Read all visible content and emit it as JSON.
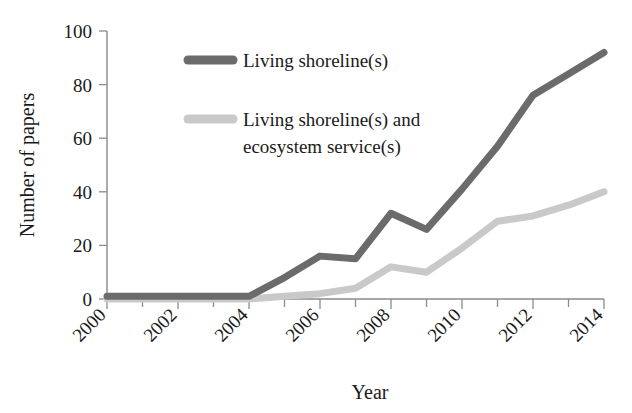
{
  "chart_data": {
    "type": "line",
    "title": "",
    "xlabel": "Year",
    "ylabel": "Number of papers",
    "x": [
      2000,
      2001,
      2002,
      2003,
      2004,
      2005,
      2006,
      2007,
      2008,
      2009,
      2010,
      2011,
      2012,
      2013,
      2014
    ],
    "xlim": [
      2000,
      2014
    ],
    "ylim": [
      0,
      100
    ],
    "xticks": [
      2000,
      2002,
      2004,
      2006,
      2008,
      2010,
      2012,
      2014
    ],
    "xtick_labels": [
      "2000",
      "2002",
      "2004",
      "2006",
      "2008",
      "2010",
      "2012",
      "2014"
    ],
    "xminor_ticks": [
      2001,
      2003,
      2005,
      2007,
      2009,
      2011,
      2013
    ],
    "yticks": [
      0,
      20,
      40,
      60,
      80,
      100
    ],
    "ytick_labels": [
      "0",
      "20",
      "40",
      "60",
      "80",
      "100"
    ],
    "grid": false,
    "legend_position": "upper-left-inside",
    "series": [
      {
        "name": "Living shoreline(s)",
        "color": "#6b6b6b",
        "values": [
          1,
          1,
          1,
          1,
          1,
          8,
          16,
          15,
          32,
          26,
          41,
          57,
          76,
          84,
          92
        ]
      },
      {
        "name": "Living shoreline(s) and ecosystem service(s)",
        "color": "#c9c9c9",
        "values": [
          0,
          0,
          0,
          0,
          0,
          1,
          2,
          4,
          12,
          10,
          19,
          29,
          31,
          35,
          40
        ]
      }
    ]
  },
  "legend": {
    "entries": [
      {
        "label": "Living shoreline(s)",
        "color": "#6b6b6b"
      },
      {
        "label_line1": "Living shoreline(s) and",
        "label_line2": "ecosystem service(s)",
        "color": "#c9c9c9"
      }
    ]
  },
  "axes": {
    "x_title": "Year",
    "y_title": "Number of papers"
  }
}
